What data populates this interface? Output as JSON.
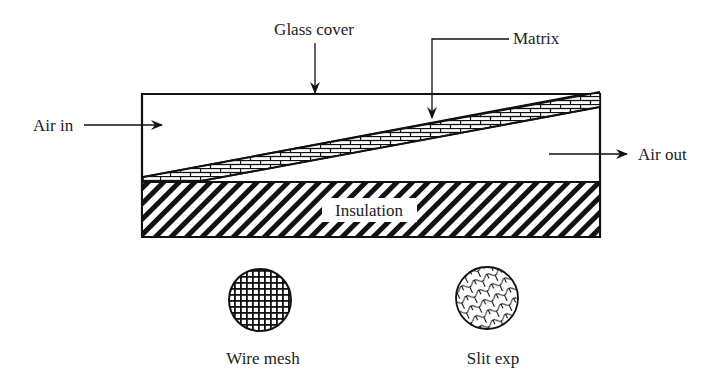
{
  "diagram": {
    "labels": {
      "glass_cover": "Glass cover",
      "matrix": "Matrix",
      "air_in": "Air in",
      "air_out": "Air out",
      "insulation": "Insulation"
    },
    "samples": [
      {
        "label": "Wire mesh",
        "pattern": "grid"
      },
      {
        "label": "Slit exp",
        "pattern": "expanded-metal"
      }
    ],
    "colors": {
      "stroke": "#111111",
      "text": "#222222",
      "background": "#ffffff"
    }
  }
}
